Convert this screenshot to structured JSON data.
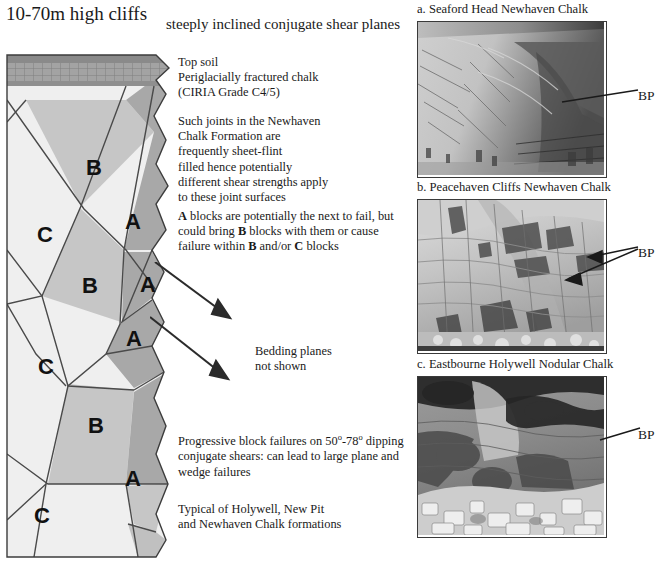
{
  "figure": {
    "cliff_height_label": "10-70m high cliffs",
    "shear_planes_heading": "steeply inclined conjugate shear planes"
  },
  "diagram": {
    "layers": {
      "topsoil_color": "#8a8a8a",
      "periglacial_color": "#a0a0a0",
      "block_a_color": "#a8a8a8",
      "block_b_color": "#c6c6c6",
      "block_c_color": "#efefef",
      "outline_color": "#3c3c3c"
    },
    "block_labels": [
      {
        "label": "B",
        "x": 88,
        "y": 121
      },
      {
        "label": "A",
        "x": 127,
        "y": 175
      },
      {
        "label": "C",
        "x": 39,
        "y": 188
      },
      {
        "label": "B",
        "x": 84,
        "y": 239
      },
      {
        "label": "A",
        "x": 142,
        "y": 238
      },
      {
        "label": "A",
        "x": 128,
        "y": 292
      },
      {
        "label": "C",
        "x": 40,
        "y": 320
      },
      {
        "label": "B",
        "x": 90,
        "y": 379
      },
      {
        "label": "A",
        "x": 127,
        "y": 432
      },
      {
        "label": "C",
        "x": 36,
        "y": 469
      },
      {
        "label": "C",
        "x": 78,
        "y": 520
      }
    ]
  },
  "notes": {
    "topsoil": [
      "Top soil",
      "Periglacially fractured chalk",
      "(CIRIA Grade C4/5)"
    ],
    "joints": [
      "Such joints in the Newhaven",
      "Chalk Formation are",
      "frequently sheet-flint",
      "filled hence potentially",
      "different shear strengths apply",
      "to these joint surfaces"
    ],
    "a_blocks_html": "<b>A</b> blocks are potentially the next to fail, but could bring <b>B</b> blocks with them or cause failure within <b>B</b> and/or <b>C</b> blocks",
    "bedding": [
      "Bedding planes",
      "not shown"
    ],
    "progressive_html": "Progressive block failures on 50<span class=\"sup\">o</span>-78<span class=\"sup\">o</span> dipping conjugate shears: can lead to large plane and wedge failures",
    "typical": [
      "Typical of Holywell, New Pit",
      "and Newhaven Chalk formations"
    ]
  },
  "photos": [
    {
      "id": "a",
      "caption": "a. Seaford Head Newhaven Chalk",
      "bp_label": "BP",
      "leader_count": 1
    },
    {
      "id": "b",
      "caption": "b. Peacehaven Cliffs Newhaven Chalk",
      "bp_label": "BP",
      "leader_count": 2
    },
    {
      "id": "c",
      "caption": "c. Eastbourne Holywell Nodular Chalk",
      "bp_label": "BP",
      "leader_count": 1
    }
  ]
}
